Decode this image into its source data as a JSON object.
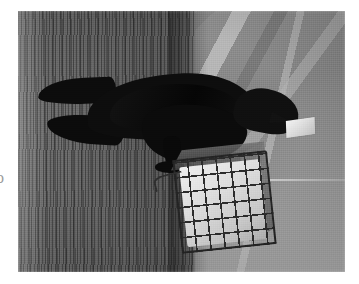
{
  "page": {
    "background_color": "#ffffff",
    "margin_glyph": "o"
  },
  "photo": {
    "caption_text": "",
    "frame": {
      "x": 18,
      "y": 11,
      "width": 327,
      "height": 261
    },
    "rendering": "grayscale halftone scan",
    "palette": {
      "paper_white": "#ffffff",
      "background_gray": "#8b8b8b",
      "highlight_gray": "#cdcdcd",
      "trunk_dark": "#4e4e4e",
      "bird_black": "#0d0d0d",
      "suet_white": "#efefef",
      "cage_wire": "#2b2b2b"
    },
    "subjects": {
      "bird": {
        "name": "perched-black-bird",
        "description": "black crow perched facing right",
        "color": "#0d0d0d"
      },
      "suet_in_beak": {
        "name": "suet-chunk-in-beak",
        "description": "white suet chunk held in the beak",
        "color": "#efefef"
      },
      "feeder": {
        "name": "suet-cage-feeder",
        "description": "wire cage feeder filled with white suet",
        "wire_color": "#2b2b2b",
        "suet_color": "#dcdcdc"
      },
      "trunk": {
        "name": "tree-trunk",
        "description": "vertically textured bark trunk on the left",
        "color": "#5e5e5e"
      },
      "background": {
        "name": "blurred-branches-background",
        "description": "out-of-focus diagonal branches and bright ground",
        "color": "#9a9a9a"
      },
      "wire_line": {
        "name": "horizontal-wire-line",
        "description": "thin pale horizontal line crossing the frame",
        "color": "#e4e4e4"
      }
    }
  }
}
